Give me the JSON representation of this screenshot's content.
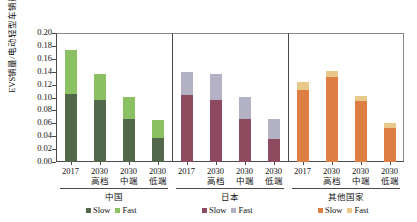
{
  "chart_data": {
    "type": "bar",
    "stacked": true,
    "title": "",
    "xlabel": "",
    "ylabel": "EVS销量/电动轻型车销量",
    "ylim": [
      0.0,
      0.2
    ],
    "ytick_labels": [
      "0.20",
      "0.18",
      "0.16",
      "0.14",
      "0.12",
      "0.10",
      "0.08",
      "0.06",
      "0.04",
      "0.02",
      "0.00"
    ],
    "ytick_values": [
      0.2,
      0.18,
      0.16,
      0.14,
      0.12,
      0.1,
      0.08,
      0.06,
      0.04,
      0.02,
      0.0
    ],
    "grid": false,
    "legend_position": "bottom",
    "groups": [
      {
        "name": "中国",
        "colors": {
          "slow": "#53684a",
          "fast": "#8cc163"
        },
        "legend": [
          {
            "label": "Slow",
            "color": "#53684a"
          },
          {
            "label": "Fast",
            "color": "#8cc163"
          }
        ],
        "categories": [
          {
            "year": "2017",
            "tier": ""
          },
          {
            "year": "2030",
            "tier": "高档"
          },
          {
            "year": "2030",
            "tier": "中端"
          },
          {
            "year": "2030",
            "tier": "低端"
          }
        ],
        "series": [
          {
            "name": "Slow",
            "values": [
              0.105,
              0.096,
              0.067,
              0.037
            ]
          },
          {
            "name": "Fast",
            "values": [
              0.069,
              0.04,
              0.034,
              0.028
            ]
          }
        ],
        "totals": [
          0.174,
          0.136,
          0.101,
          0.065
        ]
      },
      {
        "name": "日本",
        "colors": {
          "slow": "#8e4a5e",
          "fast": "#b3b2c4"
        },
        "legend": [
          {
            "label": "Slow",
            "color": "#8e4a5e"
          },
          {
            "label": "Fast",
            "color": "#b3b2c4"
          }
        ],
        "categories": [
          {
            "year": "2017",
            "tier": ""
          },
          {
            "year": "2030",
            "tier": "高档"
          },
          {
            "year": "2030",
            "tier": "中端"
          },
          {
            "year": "2030",
            "tier": "低端"
          }
        ],
        "series": [
          {
            "name": "Slow",
            "values": [
              0.104,
              0.096,
              0.067,
              0.035
            ]
          },
          {
            "name": "Fast",
            "values": [
              0.035,
              0.04,
              0.034,
              0.031
            ]
          }
        ],
        "totals": [
          0.139,
          0.136,
          0.101,
          0.066
        ]
      },
      {
        "name": "其他国家",
        "colors": {
          "slow": "#dd7f42",
          "fast": "#e9c98a"
        },
        "legend": [
          {
            "label": "Slow",
            "color": "#dd7f42"
          },
          {
            "label": "Fast",
            "color": "#e9c98a"
          }
        ],
        "categories": [
          {
            "year": "2017",
            "tier": ""
          },
          {
            "year": "2030",
            "tier": "高档"
          },
          {
            "year": "2030",
            "tier": "中端"
          },
          {
            "year": "2030",
            "tier": "低端"
          }
        ],
        "series": [
          {
            "name": "Slow",
            "values": [
              0.112,
              0.132,
              0.094,
              0.053
            ]
          },
          {
            "name": "Fast",
            "values": [
              0.012,
              0.009,
              0.008,
              0.007
            ]
          }
        ],
        "totals": [
          0.124,
          0.141,
          0.102,
          0.06
        ]
      }
    ]
  }
}
